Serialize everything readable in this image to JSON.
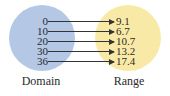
{
  "diagram": {
    "type": "mapping",
    "domain_label": "Domain",
    "range_label": "Range",
    "colors": {
      "domain": "#b4c8e6",
      "range": "#f8eaa6",
      "arrow": "#333333"
    },
    "mappings": [
      {
        "domain": "0",
        "range": "9.1"
      },
      {
        "domain": "10",
        "range": "6.7"
      },
      {
        "domain": "20",
        "range": "10.7"
      },
      {
        "domain": "30",
        "range": "13.2"
      },
      {
        "domain": "36",
        "range": "17.4"
      }
    ]
  }
}
